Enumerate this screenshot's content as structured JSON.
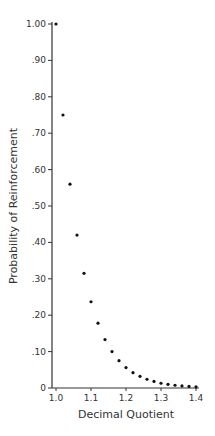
{
  "chart_data": {
    "type": "scatter",
    "title": "",
    "xlabel": "Decimal Quotient",
    "ylabel": "Probability of Reinforcement",
    "xlim": [
      1.0,
      1.4
    ],
    "ylim": [
      0,
      1.0
    ],
    "grid": false,
    "legend": null,
    "x_ticks": [
      "1.0",
      "1.1",
      "1.2",
      "1.3",
      "1.4"
    ],
    "y_ticks": [
      "0",
      ".10",
      ".20",
      ".30",
      ".40",
      ".50",
      ".60",
      ".70",
      ".80",
      ".90",
      "1.00"
    ],
    "series": [
      {
        "name": "Probability of Reinforcement",
        "x": [
          1.0,
          1.02,
          1.04,
          1.06,
          1.08,
          1.1,
          1.12,
          1.14,
          1.16,
          1.18,
          1.2,
          1.22,
          1.24,
          1.26,
          1.28,
          1.3,
          1.32,
          1.34,
          1.36,
          1.38,
          1.4
        ],
        "y": [
          1.0,
          0.75,
          0.56,
          0.42,
          0.315,
          0.237,
          0.178,
          0.133,
          0.1,
          0.075,
          0.056,
          0.042,
          0.032,
          0.024,
          0.018,
          0.013,
          0.01,
          0.0075,
          0.0056,
          0.0042,
          0.0032
        ]
      }
    ]
  }
}
